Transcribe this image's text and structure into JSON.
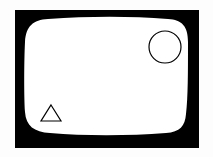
{
  "canvas": {
    "width": 213,
    "height": 157,
    "background_color": "#fdfdfd",
    "title": "Screen with shapes"
  },
  "colors": {
    "stroke": "#000000",
    "frame_fill": "#000000",
    "screen_fill": "#ffffff",
    "page_background": "#fdfdfd"
  },
  "frame": {
    "name": "tv-screen-frame",
    "shape": "rectangle",
    "fill": "#000000",
    "x": 15,
    "y": 10,
    "width": 184,
    "height": 138,
    "label": "Screen bezel"
  },
  "screen": {
    "name": "tv-screen-surface",
    "shape": "rounded-barrel-rectangle",
    "fill": "#ffffff",
    "left_mid_x": 25,
    "right_mid_x": 188,
    "top_mid_y": 19,
    "bottom_mid_y": 133,
    "label": "Screen surface"
  },
  "shapes": [
    {
      "id": "circle",
      "name": "circle-shape",
      "type": "circle",
      "cx": 165,
      "cy": 47,
      "r": 16,
      "stroke": "#000000",
      "stroke_width": 1.2,
      "fill": "none",
      "label": "Circle"
    },
    {
      "id": "triangle",
      "name": "triangle-shape",
      "type": "triangle",
      "apex_x": 51,
      "apex_y": 105,
      "base_left_x": 41,
      "base_right_x": 61,
      "base_y": 121,
      "stroke": "#000000",
      "stroke_width": 1.2,
      "fill": "none",
      "label": "Triangle"
    }
  ]
}
